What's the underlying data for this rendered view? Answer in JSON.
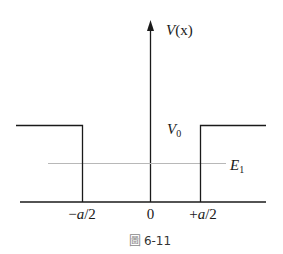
{
  "figure": {
    "caption_glyph": "圖",
    "caption_number": "6-11",
    "y_axis_label": {
      "main": "V",
      "arg": "(x)"
    },
    "barrier_label": {
      "main": "V",
      "sub": "0"
    },
    "energy_label": {
      "main": "E",
      "sub": "1"
    },
    "x_ticks": [
      {
        "label": "−a/2",
        "sign": "−",
        "var": "a",
        "rest": "/2"
      },
      {
        "label": "0"
      },
      {
        "label": "+a/2",
        "sign": "+",
        "var": "a",
        "rest": "/2"
      }
    ],
    "colors": {
      "lines": "#1a1a1a",
      "energy_line": "#b8b8b8",
      "caption_box": "#8a8a8a"
    }
  }
}
